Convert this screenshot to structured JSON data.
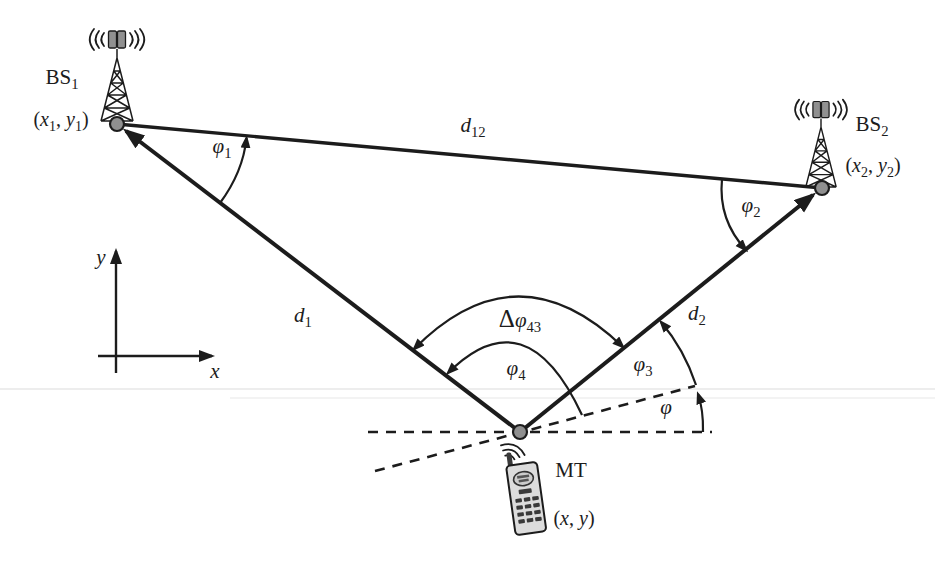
{
  "style": {
    "background": "#ffffff",
    "ink": "#1c1c1c",
    "node_fill": "#8f8f8f",
    "antenna_fill": "#909090",
    "phone_body": "#dcdcdc",
    "phone_detail": "#3a3a3a"
  },
  "icons": {
    "bs1": "radio-tower-icon",
    "bs2": "radio-tower-icon",
    "mt": "mobile-phone-icon"
  },
  "labels": {
    "bs1": {
      "base": "BS",
      "sub": "1"
    },
    "bs1_coords": {
      "open": "(",
      "x": "x",
      "xsub": "1",
      "sep": ", ",
      "y": "y",
      "ysub": "1",
      "close": ")"
    },
    "bs2": {
      "base": "BS",
      "sub": "2"
    },
    "bs2_coords": {
      "open": "(",
      "x": "x",
      "xsub": "2",
      "sep": ", ",
      "y": "y",
      "ysub": "2",
      "close": ")"
    },
    "mt": {
      "base": "MT"
    },
    "mt_coords": {
      "open": "(",
      "x": "x",
      "sep": ", ",
      "y": "y",
      "close": ")"
    },
    "d12": {
      "base": "d",
      "sub": "12"
    },
    "d1": {
      "base": "d",
      "sub": "1"
    },
    "d2": {
      "base": "d",
      "sub": "2"
    },
    "phi1": {
      "base": "φ",
      "sub": "1"
    },
    "phi2": {
      "base": "φ",
      "sub": "2"
    },
    "phi3": {
      "base": "φ",
      "sub": "3"
    },
    "phi4": {
      "base": "φ",
      "sub": "4"
    },
    "delta_phi43": {
      "delta": "Δ",
      "base": "φ",
      "sub": "43"
    },
    "phi": {
      "base": "φ"
    },
    "axis_x": {
      "base": "x"
    },
    "axis_y": {
      "base": "y"
    }
  }
}
